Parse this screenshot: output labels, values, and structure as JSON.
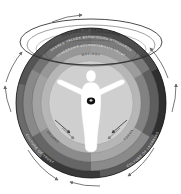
{
  "diagram": {
    "title": "Culture of Excellence",
    "type": "concentric-ring-mandala",
    "center_figure": {
      "name": "human-figure",
      "description": "Outstretched-arms human silhouette",
      "heart_marker": "heart-dot"
    },
    "rings": [
      {
        "index": 0,
        "name": "outer-band",
        "label": "CULTURE OF EXCELLENCE",
        "color": "#3c3c3c",
        "text_color": "#1d1d1d"
      },
      {
        "index": 1,
        "name": "second-band",
        "label": "SHARED VALUES  BEHAVIOURS  STANDARDS",
        "color": "#6e6e6e",
        "text_color": "#ededed"
      },
      {
        "index": 2,
        "name": "third-band",
        "label": "LEADERSHIP  ACCOUNTABILITY  TRUST",
        "color": "#909090",
        "text_color": "#f2f2f2"
      },
      {
        "index": 3,
        "name": "inner-band",
        "label": "MASTERY",
        "color": "#b4b4b4",
        "text_color": "#2a2a2a"
      },
      {
        "index": 4,
        "name": "core-disc",
        "label": "",
        "color": "#cfcfcf",
        "text_color": "#2a2a2a"
      }
    ],
    "segment_labels": {
      "bottom_left": "CULTURE OF TRUST",
      "bottom_right": "CULTURE OF LEARNING",
      "left_inner": "ENGAGEMENT",
      "right_inner": "PERFORMANCE"
    },
    "arrows": {
      "inner": {
        "name": "inward-arrow",
        "count": 4,
        "direction": "inward"
      },
      "outer": {
        "name": "orbit-arrow",
        "count": 6,
        "direction": "clockwise"
      }
    },
    "palette": {
      "background": "#ffffff",
      "darkest": "#2f2f2f",
      "dark": "#4a4a4a",
      "mid": "#767676",
      "light": "#a8a8a8",
      "lightest": "#d2d2d2",
      "figure": "#ffffff",
      "outline": "#111111"
    }
  }
}
